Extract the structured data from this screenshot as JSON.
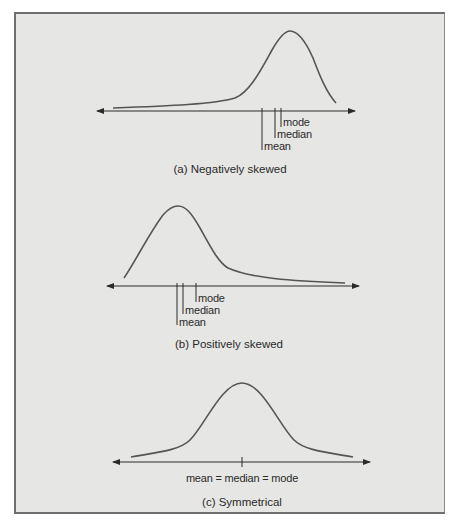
{
  "figure": {
    "panels": [
      {
        "id": "a",
        "caption": "(a) Negatively skewed",
        "markers": [
          {
            "label": "mode",
            "order_left_to_right": 3
          },
          {
            "label": "median",
            "order_left_to_right": 2
          },
          {
            "label": "mean",
            "order_left_to_right": 1
          }
        ]
      },
      {
        "id": "b",
        "caption": "(b) Positively skewed",
        "markers": [
          {
            "label": "mode",
            "order_left_to_right": 3
          },
          {
            "label": "median",
            "order_left_to_right": 2
          },
          {
            "label": "mean",
            "order_left_to_right": 1
          }
        ]
      },
      {
        "id": "c",
        "caption": "(c) Symmetrical",
        "center_label": "mean = median = mode"
      }
    ]
  },
  "labels": {
    "a_mode": "mode",
    "a_median": "median",
    "a_mean": "mean",
    "a_caption": "(a) Negatively skewed",
    "b_mode": "mode",
    "b_median": "median",
    "b_mean": "mean",
    "b_caption": "(b) Positively skewed",
    "c_center": "mean = median = mode",
    "c_caption": "(c) Symmetrical"
  },
  "colors": {
    "panel_bg": "#e6e6e4",
    "line": "#3a3a3a",
    "curve": "#555555",
    "text": "#2a2a2a"
  }
}
